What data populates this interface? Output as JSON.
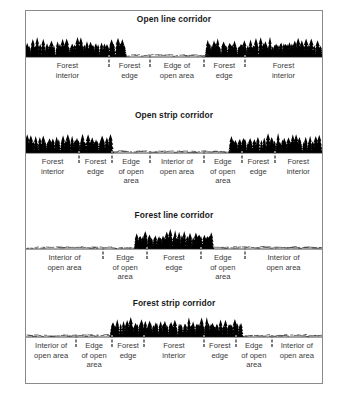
{
  "figure": {
    "panels": [
      {
        "id": "open-line-corridor",
        "title": "Open line corridor",
        "scene": {
          "type": "cross-section",
          "forest_spans": [
            [
              0,
              34
            ],
            [
              61,
              100
            ]
          ],
          "open_spans": [
            [
              34,
              61
            ]
          ],
          "ground_line": true
        },
        "segments": [
          {
            "label_line1": "Forest",
            "label_line2": "interior",
            "width_pct": 28,
            "zone": "forest-interior"
          },
          {
            "label_line1": "Forest",
            "label_line2": "edge",
            "width_pct": 14,
            "zone": "forest-edge"
          },
          {
            "label_line1": "Edge of",
            "label_line2": "open area",
            "width_pct": 18,
            "zone": "edge-of-open-area"
          },
          {
            "label_line1": "Forest",
            "label_line2": "edge",
            "width_pct": 14,
            "zone": "forest-edge"
          },
          {
            "label_line1": "Forest",
            "label_line2": "interior",
            "width_pct": 26,
            "zone": "forest-interior"
          }
        ]
      },
      {
        "id": "open-strip-corridor",
        "title": "Open strip corridor",
        "scene": {
          "type": "cross-section",
          "forest_spans": [
            [
              0,
              29
            ],
            [
              69,
              100
            ]
          ],
          "open_spans": [
            [
              29,
              69
            ]
          ],
          "ground_line": true
        },
        "segments": [
          {
            "label_line1": "Forest",
            "label_line2": "interior",
            "label_line3": "",
            "width_pct": 18,
            "zone": "forest-interior"
          },
          {
            "label_line1": "Forest",
            "label_line2": "edge",
            "label_line3": "",
            "width_pct": 11,
            "zone": "forest-edge"
          },
          {
            "label_line1": "Edge",
            "label_line2": "of open",
            "label_line3": "area",
            "width_pct": 13,
            "zone": "edge-of-open-area"
          },
          {
            "label_line1": "Interior of",
            "label_line2": "open area",
            "label_line3": "",
            "width_pct": 18,
            "zone": "interior-of-open-area"
          },
          {
            "label_line1": "Edge",
            "label_line2": "of open",
            "label_line3": "area",
            "width_pct": 13,
            "zone": "edge-of-open-area"
          },
          {
            "label_line1": "Forest",
            "label_line2": "edge",
            "label_line3": "",
            "width_pct": 11,
            "zone": "forest-edge"
          },
          {
            "label_line1": "Forest",
            "label_line2": "interior",
            "label_line3": "",
            "width_pct": 16,
            "zone": "forest-interior"
          }
        ]
      },
      {
        "id": "forest-line-corridor",
        "title": "Forest line corridor",
        "scene": {
          "type": "cross-section",
          "forest_spans": [
            [
              37,
              63
            ]
          ],
          "open_spans": [
            [
              0,
              37
            ],
            [
              63,
              100
            ]
          ],
          "ground_line": true
        },
        "segments": [
          {
            "label_line1": "Interior of",
            "label_line2": "open area",
            "label_line3": "",
            "width_pct": 26,
            "zone": "interior-of-open-area"
          },
          {
            "label_line1": "Edge",
            "label_line2": "of open",
            "label_line3": "area",
            "width_pct": 15,
            "zone": "edge-of-open-area"
          },
          {
            "label_line1": "Forest",
            "label_line2": "edge",
            "label_line3": "",
            "width_pct": 18,
            "zone": "forest-edge"
          },
          {
            "label_line1": "Edge",
            "label_line2": "of open",
            "label_line3": "area",
            "width_pct": 15,
            "zone": "edge-of-open-area"
          },
          {
            "label_line1": "Interior of",
            "label_line2": "open area",
            "label_line3": "",
            "width_pct": 26,
            "zone": "interior-of-open-area"
          }
        ]
      },
      {
        "id": "forest-strip-corridor",
        "title": "Forest strip corridor",
        "scene": {
          "type": "cross-section",
          "forest_spans": [
            [
              29,
              73
            ]
          ],
          "open_spans": [
            [
              0,
              29
            ],
            [
              73,
              100
            ]
          ],
          "ground_line": true
        },
        "segments": [
          {
            "label_line1": "Interior of",
            "label_line2": "open area",
            "label_line3": "",
            "width_pct": 17,
            "zone": "interior-of-open-area"
          },
          {
            "label_line1": "Edge",
            "label_line2": "of open",
            "label_line3": "area",
            "width_pct": 12,
            "zone": "edge-of-open-area"
          },
          {
            "label_line1": "Forest",
            "label_line2": "edge",
            "label_line3": "",
            "width_pct": 11,
            "zone": "forest-edge"
          },
          {
            "label_line1": "Forest",
            "label_line2": "interior",
            "label_line3": "",
            "width_pct": 20,
            "zone": "forest-interior"
          },
          {
            "label_line1": "Forest",
            "label_line2": "edge",
            "label_line3": "",
            "width_pct": 11,
            "zone": "forest-edge"
          },
          {
            "label_line1": "Edge",
            "label_line2": "of open",
            "label_line3": "area",
            "width_pct": 12,
            "zone": "edge-of-open-area"
          },
          {
            "label_line1": "Interior of",
            "label_line2": "open area",
            "label_line3": "",
            "width_pct": 17,
            "zone": "interior-of-open-area"
          }
        ]
      }
    ],
    "colors": {
      "forest": "#000000",
      "border": "#8a8a8a",
      "label_text": "#3a3a3a",
      "title_text": "#1a1a1a",
      "divider": "#7d7d7d",
      "background": "#ffffff"
    }
  }
}
